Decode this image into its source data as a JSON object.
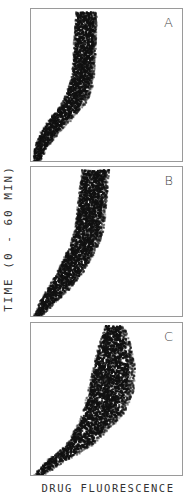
{
  "chart_data": {
    "type": "scatter",
    "title": "",
    "xlabel": "DRUG FLUORESCENCE",
    "ylabel": "TIME (0 - 60 MIN)",
    "grid": false,
    "panels": [
      {
        "label": "A",
        "description": "Dense cell population; fluorescence rises over early time then plateaus at a narrow band",
        "ridge_x": [
          0.03,
          0.06,
          0.12,
          0.2,
          0.28,
          0.32,
          0.34,
          0.35,
          0.36
        ],
        "ridge_time": [
          0.0,
          0.1,
          0.2,
          0.3,
          0.4,
          0.5,
          0.6,
          0.8,
          1.0
        ],
        "band_width": [
          0.04,
          0.08,
          0.12,
          0.14,
          0.15,
          0.15,
          0.14,
          0.14,
          0.13
        ]
      },
      {
        "label": "B",
        "description": "Fluorescence rises more gradually with a broader band at later times",
        "ridge_x": [
          0.03,
          0.1,
          0.18,
          0.25,
          0.3,
          0.35,
          0.38,
          0.4,
          0.42
        ],
        "ridge_time": [
          0.0,
          0.1,
          0.2,
          0.3,
          0.4,
          0.5,
          0.6,
          0.8,
          1.0
        ],
        "band_width": [
          0.04,
          0.1,
          0.14,
          0.16,
          0.18,
          0.18,
          0.18,
          0.18,
          0.17
        ]
      },
      {
        "label": "C",
        "description": "Low initial uptake followed by a strong rise to high fluorescence with wide scatter",
        "ridge_x": [
          0.03,
          0.15,
          0.3,
          0.38,
          0.45,
          0.5,
          0.52,
          0.53,
          0.53
        ],
        "ridge_time": [
          0.0,
          0.1,
          0.2,
          0.3,
          0.4,
          0.55,
          0.7,
          0.85,
          0.95
        ],
        "band_width": [
          0.04,
          0.1,
          0.14,
          0.18,
          0.22,
          0.24,
          0.22,
          0.16,
          0.1
        ]
      }
    ],
    "xlim": [
      0,
      1
    ],
    "ylim": [
      0,
      60
    ]
  },
  "labels": {
    "panel_a": "A",
    "panel_b": "B",
    "panel_c": "C",
    "x_axis": "DRUG FLUORESCENCE",
    "y_axis": "TIME (0 - 60 MIN)"
  }
}
